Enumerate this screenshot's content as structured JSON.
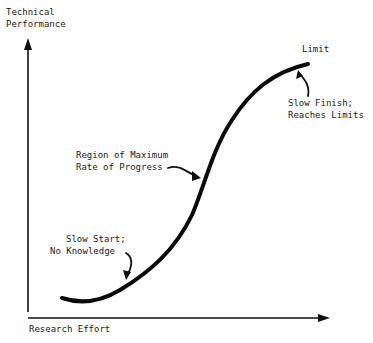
{
  "diagram": {
    "y_axis_label_line1": "Technical",
    "y_axis_label_line2": "Performance",
    "x_axis_label": "Research Effort",
    "annotations": {
      "limit": "Limit",
      "slow_finish_line1": "Slow Finish;",
      "slow_finish_line2": "Reaches Limits",
      "max_rate_line1": "Region of Maximum",
      "max_rate_line2": "Rate of Progress",
      "slow_start_line1": "Slow Start;",
      "slow_start_line2": "No Knowledge"
    }
  }
}
